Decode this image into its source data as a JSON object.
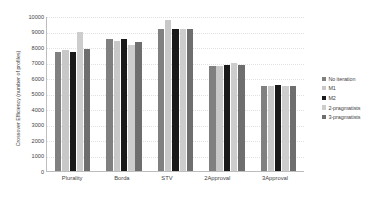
{
  "chart_data": {
    "type": "bar",
    "title": "",
    "xlabel": "",
    "ylabel": "Crossover Efficiency (number of profiles)",
    "ylim": [
      0,
      10000
    ],
    "ytick_labels": [
      "10000",
      "9000",
      "8000",
      "7000",
      "6000",
      "5000",
      "4000",
      "3000",
      "2000",
      "1000",
      "0"
    ],
    "ytick_values": [
      10000,
      9000,
      8000,
      7000,
      6000,
      5000,
      4000,
      3000,
      2000,
      1000,
      0
    ],
    "grid": false,
    "legend_position": "right",
    "categories": [
      "Plurality",
      "Borda",
      "STV",
      "2Approval",
      "3Approval"
    ],
    "series": [
      {
        "name": "No iteration",
        "color": "#808080",
        "values": [
          7650,
          8500,
          9150,
          6800,
          5500
        ]
      },
      {
        "name": "M1",
        "color": "#c8c8c8",
        "values": [
          7800,
          8400,
          9750,
          6780,
          5500
        ]
      },
      {
        "name": "M2",
        "color": "#1a1a1a",
        "values": [
          7700,
          8520,
          9180,
          6820,
          5530
        ]
      },
      {
        "name": "2-pragmatists",
        "color": "#cdcdcd",
        "values": [
          8950,
          8100,
          9150,
          7000,
          5500
        ]
      },
      {
        "name": "3-pragmatists",
        "color": "#6e6e6e",
        "values": [
          7900,
          8350,
          9150,
          6830,
          5500
        ]
      }
    ]
  },
  "legend": {
    "items": [
      {
        "label": "No iteration",
        "color": "#808080"
      },
      {
        "label": "M1",
        "color": "#c8c8c8"
      },
      {
        "label": "M2",
        "color": "#1a1a1a"
      },
      {
        "label": "2-pragmatists",
        "color": "#cdcdcd"
      },
      {
        "label": "3-pragmatists",
        "color": "#6e6e6e"
      }
    ]
  },
  "axes": {
    "y_title": "Crossover Efficiency (number of profiles)",
    "origin_label": "0"
  }
}
